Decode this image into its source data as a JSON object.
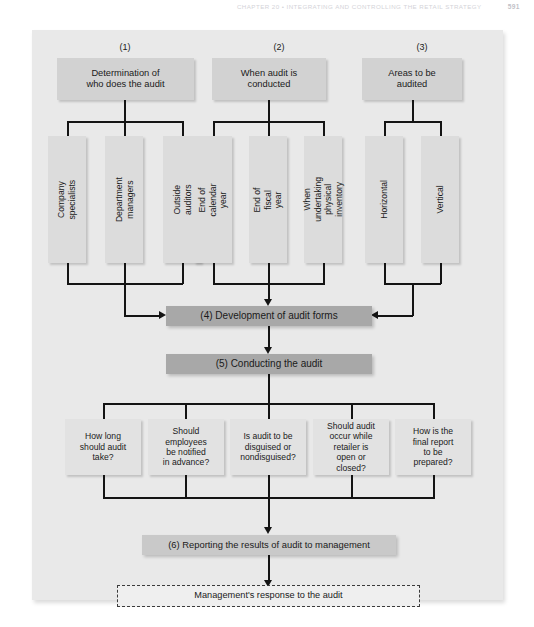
{
  "running_head": {
    "title": "CHAPTER 20 • INTEGRATING AND CONTROLLING THE RETAIL STRATEGY",
    "page": "591"
  },
  "figure": {
    "captions": [
      {
        "label": "(1)"
      },
      {
        "label": "(2)"
      },
      {
        "label": "(3)"
      }
    ],
    "top_boxes": [
      {
        "label": "Determination of\nwho does the audit"
      },
      {
        "label": "When audit is\nconducted"
      },
      {
        "label": "Areas to be\naudited"
      }
    ],
    "group1_items": [
      {
        "label": "Company\nspecialists"
      },
      {
        "label": "Department\nmanagers"
      },
      {
        "label": "Outside\nauditors"
      }
    ],
    "group2_items": [
      {
        "label": "End of calendar\nyear"
      },
      {
        "label": "End of fiscal\nyear"
      },
      {
        "label": "When undertaking\nphysical inventory"
      }
    ],
    "group3_items": [
      {
        "label": "Horizontal"
      },
      {
        "label": "Vertical"
      }
    ],
    "bar_step4": "(4) Development of audit forms",
    "bar_step5": "(5) Conducting the audit",
    "questions": [
      {
        "label": "How long\nshould audit\ntake?"
      },
      {
        "label": "Should\nemployees\nbe notified\nin advance?"
      },
      {
        "label": "Is audit to be\ndisguised or\nnondisguised?"
      },
      {
        "label": "Should audit\noccur while\nretailer is\nopen or\nclosed?"
      },
      {
        "label": "How is the\nfinal report\nto be\nprepared?"
      }
    ],
    "bar_step6": "(6) Reporting the results of audit to management",
    "outcome": "Management's response to the audit"
  },
  "colors": {
    "panel_bg": "#e9e9e9",
    "top_box": "#d2d2d2",
    "vert_box": "#dcdcdc",
    "bar_dark": "#a8a8a8",
    "bar_light": "#c9c9c9",
    "question_box": "#e2e2e2",
    "outcome_box": "#efefef",
    "line": "#141414"
  }
}
